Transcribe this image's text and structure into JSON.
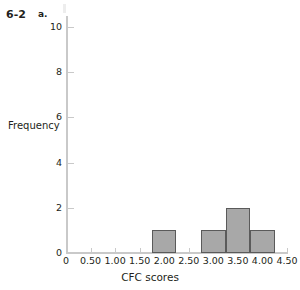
{
  "exercise": {
    "number": "6-2",
    "part": "a."
  },
  "chart_data": {
    "type": "bar",
    "title": "",
    "subtitle": "",
    "xlabel": "CFC scores",
    "ylabel": "Frequency",
    "xlim": [
      0,
      4.5
    ],
    "ylim": [
      0,
      10
    ],
    "grid": false,
    "legend": null,
    "bar_color": "#a8a8a8",
    "bar_edge_color": "#5a5a5a",
    "axis_color": "#c9c9c9",
    "x_tick_labels": [
      "0",
      "0.50",
      "1.00",
      "1.50",
      "2.00",
      "2.50",
      "3.00",
      "3.50",
      "4.00",
      "4.50"
    ],
    "x_tick_values": [
      0,
      0.5,
      1.0,
      1.5,
      2.0,
      2.5,
      3.0,
      3.5,
      4.0,
      4.5
    ],
    "y_tick_labels": [
      "0",
      "2",
      "4",
      "6",
      "8",
      "10"
    ],
    "y_tick_values": [
      0,
      2,
      4,
      6,
      8,
      10
    ],
    "bins": [
      {
        "x0": 1.75,
        "x1": 2.25,
        "value": 1
      },
      {
        "x0": 2.75,
        "x1": 3.25,
        "value": 1
      },
      {
        "x0": 3.25,
        "x1": 3.75,
        "value": 2
      },
      {
        "x0": 3.75,
        "x1": 4.25,
        "value": 1
      }
    ],
    "categories": [
      "1.75-2.25",
      "2.75-3.25",
      "3.25-3.75",
      "3.75-4.25"
    ],
    "values": [
      1,
      1,
      2,
      1
    ]
  }
}
